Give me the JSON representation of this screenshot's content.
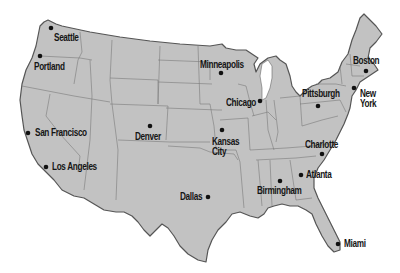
{
  "map": {
    "title": "United States major cities",
    "colors": {
      "land": "#c2c2c2",
      "outline": "#555555",
      "state_border": "#7a7a7a",
      "water": "#ffffff",
      "city": "#111111"
    },
    "cities": [
      {
        "name": "Seattle",
        "dot": [
          51,
          28
        ],
        "label": [
          54,
          33
        ]
      },
      {
        "name": "Portland",
        "dot": [
          40,
          56
        ],
        "label": [
          34,
          62
        ]
      },
      {
        "name": "San Francisco",
        "dot": [
          28,
          133
        ],
        "label": [
          35,
          128
        ]
      },
      {
        "name": "Los Angeles",
        "dot": [
          46,
          167
        ],
        "label": [
          52,
          162
        ]
      },
      {
        "name": "Denver",
        "dot": [
          150,
          126
        ],
        "label": [
          135,
          132
        ]
      },
      {
        "name": "Minneapolis",
        "dot": [
          221,
          73
        ],
        "label": [
          200,
          60
        ]
      },
      {
        "name": "Chicago",
        "dot": [
          260,
          101
        ],
        "label": [
          226,
          98
        ]
      },
      {
        "name": "Kansas City",
        "dot": [
          222,
          130
        ],
        "label": [
          212,
          137
        ]
      },
      {
        "name": "Dallas",
        "dot": [
          208,
          197
        ],
        "label": [
          180,
          192
        ]
      },
      {
        "name": "Pittsburgh",
        "dot": [
          318,
          106
        ],
        "label": [
          302,
          89
        ]
      },
      {
        "name": "Boston",
        "dot": [
          366,
          71
        ],
        "label": [
          353,
          56
        ]
      },
      {
        "name": "New York",
        "dot": [
          354,
          88
        ],
        "label": [
          360,
          89
        ]
      },
      {
        "name": "Charlotte",
        "dot": [
          322,
          154
        ],
        "label": [
          305,
          140
        ]
      },
      {
        "name": "Atlanta",
        "dot": [
          301,
          175
        ],
        "label": [
          306,
          170
        ]
      },
      {
        "name": "Birmingham",
        "dot": [
          280,
          181
        ],
        "label": [
          257,
          186
        ]
      },
      {
        "name": "Miami",
        "dot": [
          338,
          244
        ],
        "label": [
          344,
          239
        ]
      }
    ]
  }
}
